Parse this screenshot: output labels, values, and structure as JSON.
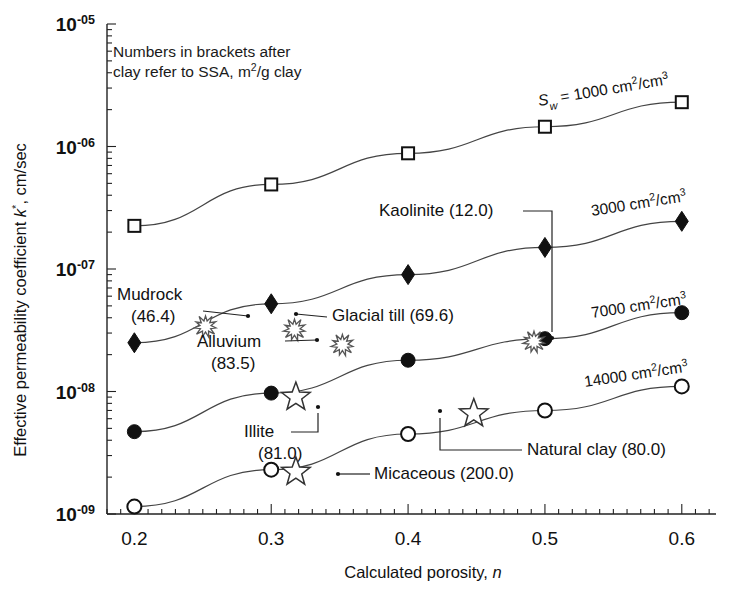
{
  "figure": {
    "note_line1": "Numbers in brackets after",
    "note_line2": "clay refer to SSA, m",
    "note_line2_sup": "2",
    "note_line2_tail": "/g clay"
  },
  "chart_data": {
    "type": "line",
    "title": "",
    "xlabel": "Calculated porosity, n",
    "ylabel": "Effective permeability coefficient k*, cm/sec",
    "xlim": [
      0.18,
      0.625
    ],
    "ylim": [
      1e-09,
      1e-05
    ],
    "yscale": "log",
    "grid": false,
    "legend_position": "inline-right-of-series",
    "xticks": [
      0.2,
      0.3,
      0.4,
      0.5,
      0.6
    ],
    "xticklabels": [
      "0.2",
      "0.3",
      "0.4",
      "0.5",
      "0.6"
    ],
    "yticks": [
      1e-09,
      1e-08,
      1e-07,
      1e-06,
      1e-05
    ],
    "yticklabels": [
      "10-09",
      "10-08",
      "10-07",
      "10-06",
      "10-05"
    ],
    "x": [
      0.2,
      0.3,
      0.4,
      0.5,
      0.6
    ],
    "series": [
      {
        "name": "Sw = 1000 cm2/cm3",
        "label_main": "S",
        "label_sub": "w",
        "label_rest": " = 1000 cm",
        "label_sup1": "2",
        "label_mid": "/cm",
        "label_sup2": "3",
        "marker": "open-square",
        "values": [
          2.25e-07,
          4.9e-07,
          8.8e-07,
          1.45e-06,
          2.3e-06
        ]
      },
      {
        "name": "3000 cm2/cm3",
        "label_rest": "3000 cm",
        "label_sup1": "2",
        "label_mid": "/cm",
        "label_sup2": "3",
        "marker": "filled-diamond",
        "values": [
          2.5e-08,
          5.2e-08,
          9e-08,
          1.5e-07,
          2.45e-07
        ]
      },
      {
        "name": "7000 cm2/cm3",
        "label_rest": "7000 cm",
        "label_sup1": "2",
        "label_mid": "/cm",
        "label_sup2": "3",
        "marker": "filled-circle",
        "values": [
          4.7e-09,
          9.7e-09,
          1.8e-08,
          2.7e-08,
          4.4e-08
        ]
      },
      {
        "name": "14000 cm2/cm3",
        "label_rest": "14000 cm",
        "label_sup1": "2",
        "label_mid": "/cm",
        "label_sup2": "3",
        "marker": "open-circle",
        "values": [
          1.15e-09,
          2.3e-09,
          4.5e-09,
          7e-09,
          1.1e-08
        ]
      }
    ],
    "annotations": [
      {
        "id": "mudrock",
        "text_line1": "Mudrock",
        "text_line2": "(46.4)",
        "marker": "starburst",
        "point": [
          0.252,
          3.4e-08
        ]
      },
      {
        "id": "glacial-till",
        "text_line1": "Glacial till (69.6)",
        "text_line2": "",
        "marker": "starburst",
        "point": [
          0.317,
          3.2e-08
        ]
      },
      {
        "id": "alluvium",
        "text_line1": "Alluvium",
        "text_line2": "(83.5)",
        "marker": "starburst",
        "point": [
          0.352,
          2.4e-08
        ]
      },
      {
        "id": "kaolinite",
        "text_line1": "Kaolinite (12.0)",
        "text_line2": "",
        "marker": "starburst",
        "point": [
          0.492,
          2.55e-08
        ]
      },
      {
        "id": "illite",
        "text_line1": "Illite",
        "text_line2": "(81.0)",
        "marker": "star5",
        "point": [
          0.318,
          9e-09
        ]
      },
      {
        "id": "micaceous",
        "text_line1": "Micaceous (200.0)",
        "text_line2": "",
        "marker": "star5",
        "point": [
          0.318,
          2.2e-09
        ]
      },
      {
        "id": "natural-clay",
        "text_line1": "Natural clay (80.0)",
        "text_line2": "",
        "marker": "star5",
        "point": [
          0.448,
          6.6e-09
        ]
      }
    ]
  }
}
